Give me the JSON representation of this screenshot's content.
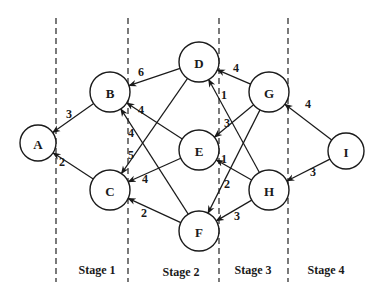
{
  "diagram": {
    "colors": {
      "stroke": "#1a1a1a",
      "background": "#ffffff"
    },
    "dividers": [
      {
        "x": 56,
        "y1": 18,
        "y2": 282
      },
      {
        "x": 128,
        "y1": 18,
        "y2": 282
      },
      {
        "x": 219,
        "y1": 18,
        "y2": 282
      },
      {
        "x": 288,
        "y1": 18,
        "y2": 282
      }
    ],
    "stages": [
      {
        "label": "Stage 1",
        "x": 97,
        "y": 270
      },
      {
        "label": "Stage 2",
        "x": 181,
        "y": 272
      },
      {
        "label": "Stage 3",
        "x": 253,
        "y": 270
      },
      {
        "label": "Stage 4",
        "x": 326,
        "y": 270
      }
    ],
    "nodes": [
      {
        "id": "A",
        "label": "A",
        "x": 38,
        "y": 143,
        "r": 18
      },
      {
        "id": "B",
        "label": "B",
        "x": 110,
        "y": 92,
        "r": 20
      },
      {
        "id": "C",
        "label": "C",
        "x": 110,
        "y": 190,
        "r": 20
      },
      {
        "id": "D",
        "label": "D",
        "x": 199,
        "y": 62,
        "r": 20
      },
      {
        "id": "E",
        "label": "E",
        "x": 199,
        "y": 150,
        "r": 20
      },
      {
        "id": "F",
        "label": "F",
        "x": 199,
        "y": 231,
        "r": 20
      },
      {
        "id": "G",
        "label": "G",
        "x": 269,
        "y": 92,
        "r": 20
      },
      {
        "id": "H",
        "label": "H",
        "x": 269,
        "y": 190,
        "r": 20
      },
      {
        "id": "I",
        "label": "I",
        "x": 346,
        "y": 151,
        "r": 18
      }
    ],
    "edges": [
      {
        "from": "B",
        "to": "A",
        "weight": "3",
        "lx": 69,
        "ly": 114
      },
      {
        "from": "C",
        "to": "A",
        "weight": "2",
        "lx": 62,
        "ly": 162
      },
      {
        "from": "D",
        "to": "B",
        "weight": "6",
        "lx": 141,
        "ly": 72
      },
      {
        "from": "E",
        "to": "B",
        "weight": "4",
        "lx": 141,
        "ly": 110
      },
      {
        "from": "F",
        "to": "B",
        "weight": "4",
        "lx": 131,
        "ly": 133
      },
      {
        "from": "D",
        "to": "C",
        "weight": "5",
        "lx": 131,
        "ly": 155
      },
      {
        "from": "E",
        "to": "C",
        "weight": "4",
        "lx": 145,
        "ly": 179
      },
      {
        "from": "F",
        "to": "C",
        "weight": "2",
        "lx": 144,
        "ly": 213
      },
      {
        "from": "G",
        "to": "D",
        "weight": "4",
        "lx": 236,
        "ly": 68
      },
      {
        "from": "H",
        "to": "D",
        "weight": "1",
        "lx": 224,
        "ly": 95
      },
      {
        "from": "G",
        "to": "E",
        "weight": "3",
        "lx": 227,
        "ly": 123
      },
      {
        "from": "H",
        "to": "E",
        "weight": "1",
        "lx": 224,
        "ly": 159
      },
      {
        "from": "G",
        "to": "F",
        "weight": "2",
        "lx": 227,
        "ly": 184
      },
      {
        "from": "H",
        "to": "F",
        "weight": "3",
        "lx": 237,
        "ly": 216
      },
      {
        "from": "I",
        "to": "G",
        "weight": "4",
        "lx": 308,
        "ly": 104
      },
      {
        "from": "I",
        "to": "H",
        "weight": "3",
        "lx": 313,
        "ly": 172
      }
    ]
  }
}
